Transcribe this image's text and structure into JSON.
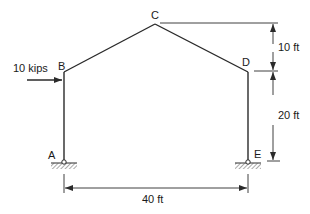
{
  "diagram": {
    "top_cut_text": "",
    "nodes": {
      "A": {
        "label": "A",
        "support": "pin"
      },
      "B": {
        "label": "B"
      },
      "C": {
        "label": "C"
      },
      "D": {
        "label": "D"
      },
      "E": {
        "label": "E",
        "support": "pin"
      }
    },
    "load": {
      "label": "10 kips",
      "at": "B",
      "direction": "right"
    },
    "dimensions": {
      "roof_rise": "10 ft",
      "column_height": "20 ft",
      "span": "40 ft"
    },
    "colors": {
      "line": "#2a2a2a",
      "hatch": "#555555"
    }
  }
}
